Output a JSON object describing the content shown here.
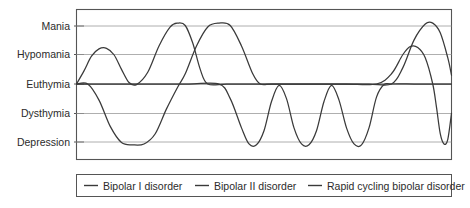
{
  "chart_data": {
    "type": "line",
    "title": "",
    "xlabel": "",
    "ylabel": "",
    "grid": true,
    "legend_position": "bottom",
    "categories": [],
    "ytick_labels": [
      "Mania",
      "Hypomania",
      "Euthymia",
      "Dysthymia",
      "Depression"
    ],
    "ylevels": [
      2,
      1,
      0,
      -1,
      -2
    ],
    "ylim": [
      -2.6,
      2.6
    ],
    "xlim": [
      0,
      100
    ],
    "axis_labels": {
      "mania": "Mania",
      "hypomania": "Hypomania",
      "euthymia": "Euthymia",
      "dysthymia": "Dysthymia",
      "depression": "Depression"
    },
    "series": [
      {
        "name": "Bipolar I disorder",
        "description": "Full mania peaks alternating with deep depression",
        "points": [
          [
            0,
            0
          ],
          [
            3,
            0
          ],
          [
            6,
            -0.55
          ],
          [
            9,
            -1.45
          ],
          [
            12,
            -2.0
          ],
          [
            15,
            -2.08
          ],
          [
            18,
            -2.05
          ],
          [
            21,
            -1.7
          ],
          [
            24,
            -0.85
          ],
          [
            27,
            -0.1
          ],
          [
            29,
            0.35
          ],
          [
            32,
            1.3
          ],
          [
            35,
            1.95
          ],
          [
            38,
            2.08
          ],
          [
            41,
            2.0
          ],
          [
            44,
            1.3
          ],
          [
            47,
            0.35
          ],
          [
            49,
            0.0
          ],
          [
            52,
            0.0
          ],
          [
            57,
            0.0
          ],
          [
            62,
            0.0
          ],
          [
            70,
            0.0
          ],
          [
            78,
            0.0
          ],
          [
            84,
            0.0
          ],
          [
            87,
            0.55
          ],
          [
            90,
            1.5
          ],
          [
            93,
            2.05
          ],
          [
            95,
            2.08
          ],
          [
            97,
            1.75
          ],
          [
            99,
            0.9
          ],
          [
            100,
            0.3
          ]
        ]
      },
      {
        "name": "Bipolar II disorder",
        "description": "Hypomanic elevations with dysthymic and depressive lows",
        "points": [
          [
            0,
            0
          ],
          [
            2,
            0.45
          ],
          [
            4,
            0.95
          ],
          [
            6,
            1.2
          ],
          [
            8,
            1.22
          ],
          [
            10,
            1.0
          ],
          [
            12,
            0.5
          ],
          [
            14,
            0.05
          ],
          [
            16,
            -0.02
          ],
          [
            19,
            0.4
          ],
          [
            22,
            1.3
          ],
          [
            25,
            1.95
          ],
          [
            27,
            2.08
          ],
          [
            29,
            2.0
          ],
          [
            31,
            1.4
          ],
          [
            33,
            0.5
          ],
          [
            35,
            0.0
          ],
          [
            40,
            0.0
          ],
          [
            48,
            0.0
          ],
          [
            56,
            0.0
          ],
          [
            64,
            0.0
          ],
          [
            72,
            0.0
          ],
          [
            80,
            0.0
          ],
          [
            84,
            0.35
          ],
          [
            87,
            1.0
          ],
          [
            89,
            1.28
          ],
          [
            91,
            1.25
          ],
          [
            93,
            0.9
          ],
          [
            95,
            0.0
          ],
          [
            96,
            -0.8
          ],
          [
            97,
            -1.7
          ],
          [
            98,
            -2.05
          ],
          [
            99,
            -1.9
          ],
          [
            100,
            -1.0
          ]
        ]
      },
      {
        "name": "Rapid cycling bipolar disorder",
        "description": "Frequent short cycles of depression across the middle of the timeline",
        "points": [
          [
            0,
            0
          ],
          [
            10,
            0
          ],
          [
            20,
            0
          ],
          [
            30,
            0
          ],
          [
            38,
            0
          ],
          [
            41,
            -0.5
          ],
          [
            44,
            -1.5
          ],
          [
            46,
            -2.05
          ],
          [
            48,
            -2.08
          ],
          [
            50,
            -1.6
          ],
          [
            52,
            -0.6
          ],
          [
            54,
            -0.05
          ],
          [
            56,
            -0.5
          ],
          [
            58,
            -1.5
          ],
          [
            60,
            -2.05
          ],
          [
            62,
            -2.08
          ],
          [
            64,
            -1.6
          ],
          [
            66,
            -0.6
          ],
          [
            68,
            -0.05
          ],
          [
            70,
            -0.55
          ],
          [
            72,
            -1.5
          ],
          [
            74,
            -2.05
          ],
          [
            76,
            -2.08
          ],
          [
            78,
            -1.5
          ],
          [
            80,
            -0.45
          ],
          [
            82,
            -0.02
          ],
          [
            84,
            0.0
          ],
          [
            90,
            0.0
          ],
          [
            95,
            0.0
          ],
          [
            100,
            0.0
          ]
        ]
      }
    ],
    "legend": [
      {
        "label": "Bipolar I disorder",
        "marker": "line-dash",
        "color": "#3a3a3a"
      },
      {
        "label": "Bipolar II disorder",
        "marker": "line-dash",
        "color": "#3a3a3a"
      },
      {
        "label": "Rapid cycling bipolar disorder",
        "marker": "line-dash",
        "color": "#3a3a3a"
      }
    ]
  },
  "colors": {
    "curve": "#3a3a3a",
    "gridline": "#9b9b9b",
    "frame": "#555555",
    "text": "#2b2b2b",
    "background": "#ffffff"
  }
}
